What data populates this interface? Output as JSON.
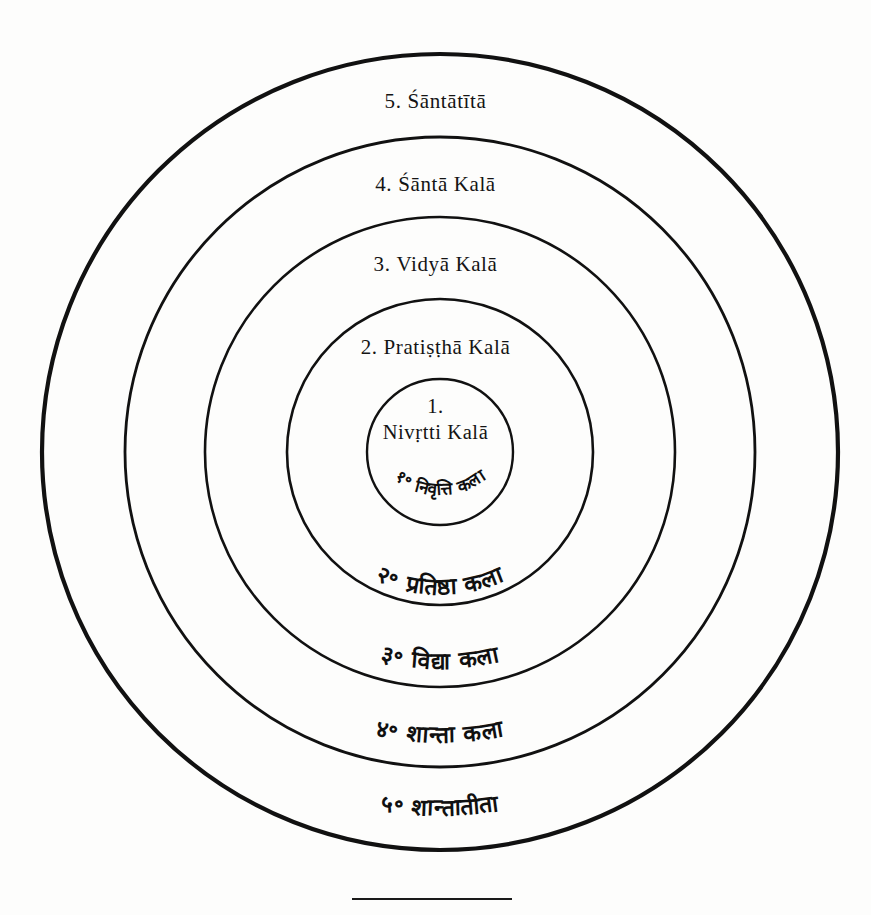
{
  "figure": {
    "type": "concentric-circle-diagram",
    "ring_count": 5,
    "background_color": "#fdfdfc",
    "ink_color": "#111111",
    "center_x": 440,
    "center_y": 452
  },
  "rings": [
    {
      "index": "1.",
      "index_devanagari": "१॰",
      "latin": "Nivṛtti Kalā",
      "devanagari": "निवृत्ति कला",
      "radius": 73,
      "stroke_width": 2.4
    },
    {
      "index": "2.",
      "index_devanagari": "२॰",
      "latin": "Pratiṣṭhā Kalā",
      "devanagari": "प्रतिष्ठा कला",
      "radius": 153,
      "stroke_width": 2.6
    },
    {
      "index": "3.",
      "index_devanagari": "३॰",
      "latin": "Vidyā Kalā",
      "devanagari": "विद्या कला",
      "radius": 235,
      "stroke_width": 2.6
    },
    {
      "index": "4.",
      "index_devanagari": "४॰",
      "latin": "Śāntā Kalā",
      "devanagari": "शान्ता कला",
      "radius": 315,
      "stroke_width": 2.8
    },
    {
      "index": "5.",
      "index_devanagari": "५॰",
      "latin": "Śāntātītā",
      "devanagari": "शान्तातीता",
      "radius": 398,
      "stroke_width": 4.2
    }
  ],
  "footer": {
    "rule_present": true
  }
}
